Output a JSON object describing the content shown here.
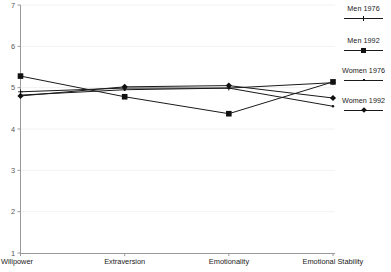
{
  "chart_data": {
    "type": "line",
    "title": "",
    "xlabel": "",
    "ylabel": "",
    "categories": [
      "Willpower",
      "Extraversion",
      "Emotionality",
      "Emotional Stability"
    ],
    "ylim": [
      1,
      7
    ],
    "yticks": [
      1,
      2,
      3,
      4,
      5,
      6,
      7
    ],
    "grid": true,
    "legend_position": "right",
    "series": [
      {
        "name": "Men 1976",
        "marker": "plus",
        "values": [
          4.9,
          4.99,
          4.99,
          5.12
        ]
      },
      {
        "name": "Men 1992",
        "marker": "square",
        "values": [
          5.28,
          4.78,
          4.37,
          5.14
        ]
      },
      {
        "name": "Women 1976",
        "marker": "dot",
        "values": [
          4.82,
          4.95,
          4.99,
          4.55
        ]
      },
      {
        "name": "Women 1992",
        "marker": "diamond",
        "values": [
          4.8,
          5.02,
          5.05,
          4.75
        ]
      }
    ]
  },
  "axis": {
    "y_tick_labels": [
      "7",
      "6",
      "5",
      "4",
      "3",
      "2",
      "1"
    ],
    "x_tick_labels": [
      "Willpower",
      "Extraversion",
      "Emotionality",
      "Emotional Stability"
    ]
  },
  "legend": {
    "entries": [
      {
        "label": "Men 1976",
        "marker": "plus"
      },
      {
        "label": "Men 1992",
        "marker": "square"
      },
      {
        "label": "Women 1976",
        "marker": "dot"
      },
      {
        "label": "Women 1992",
        "marker": "diamond"
      }
    ]
  },
  "colors": {
    "line": "#1a1a1a",
    "marker": "#111111",
    "grid": "#f2f2f2",
    "axis": "#999999",
    "text": "#1a1a1a",
    "tick_text": "#555555",
    "background": "#ffffff"
  }
}
